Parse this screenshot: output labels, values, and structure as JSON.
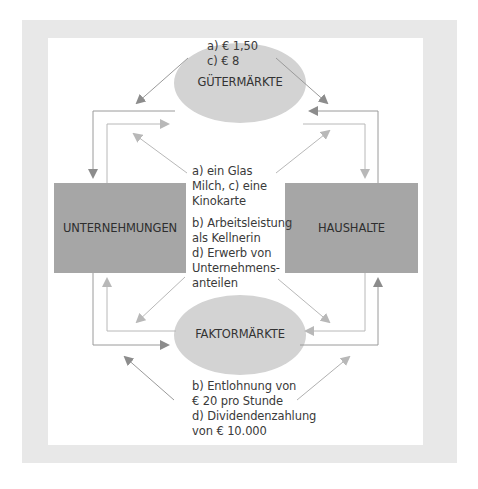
{
  "colors": {
    "frame": "#e8e8e8",
    "box": "#a6a6a6",
    "ellipse": "#d3d3d3",
    "arrow_dark": "#8c8c8c",
    "arrow_light": "#b5b5b5"
  },
  "nodes": {
    "goods_market": "GÜTERMÄRKTE",
    "factor_market": "FAKTORMÄRKTE",
    "firms": "UNTERNEHMUNGEN",
    "households": "HAUSHALTE"
  },
  "labels": {
    "top": [
      "a) € 1,50",
      "c) € 8"
    ],
    "middle_goods": [
      "a) ein Glas",
      "Milch, c) eine",
      "Kinokarte"
    ],
    "middle_factors": [
      "b) Arbeitsleistung",
      "als Kellnerin",
      "d) Erwerb von",
      "Unternehmens-",
      "anteilen"
    ],
    "bottom": [
      "b) Entlohnung von",
      "€ 20 pro Stunde",
      "d) Dividendenzahlung",
      "von € 10.000"
    ]
  }
}
